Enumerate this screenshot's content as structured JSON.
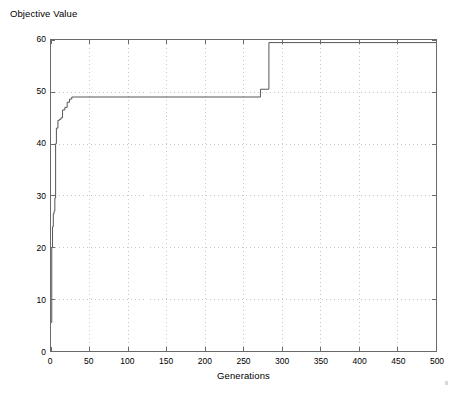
{
  "figure": {
    "y_axis_title": "Objective Value",
    "x_axis_title": "Generations",
    "background_color": "#ffffff",
    "axis_color": "#6a6a6a",
    "grid_color": "#c8c8c8",
    "series_color": "#555555"
  },
  "chart_data": {
    "type": "line",
    "title": "",
    "xlabel": "Generations",
    "ylabel": "Objective Value",
    "xlim": [
      0,
      500
    ],
    "ylim": [
      0,
      60
    ],
    "xticks": [
      0,
      50,
      100,
      150,
      200,
      250,
      300,
      350,
      400,
      450,
      500
    ],
    "yticks": [
      0,
      10,
      20,
      30,
      40,
      50,
      60
    ],
    "grid": true,
    "grid_style": "dotted",
    "legend": null,
    "series": [
      {
        "name": "Best Objective Value",
        "step": "post",
        "x": [
          0,
          1,
          2,
          3,
          4,
          5,
          6,
          7,
          9,
          11,
          13,
          15,
          18,
          21,
          24,
          27,
          31,
          265,
          272,
          278,
          283,
          287,
          500
        ],
        "y": [
          5.5,
          20.0,
          24.0,
          26.5,
          27.0,
          29.5,
          40.0,
          43.0,
          44.5,
          44.7,
          45.0,
          46.5,
          47.0,
          48.0,
          48.6,
          49.0,
          49.0,
          49.0,
          50.5,
          50.5,
          59.5,
          59.5,
          59.5
        ]
      }
    ],
    "annotations": []
  }
}
